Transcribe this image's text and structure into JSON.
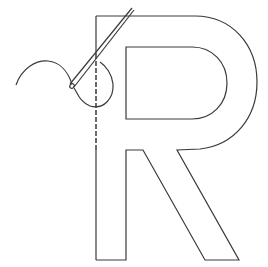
{
  "illustration": {
    "subject": "Letter R outline being sewn with needle and thread",
    "letter": "R",
    "stroke_color": "#3a3a3a",
    "background_color": "#ffffff"
  }
}
